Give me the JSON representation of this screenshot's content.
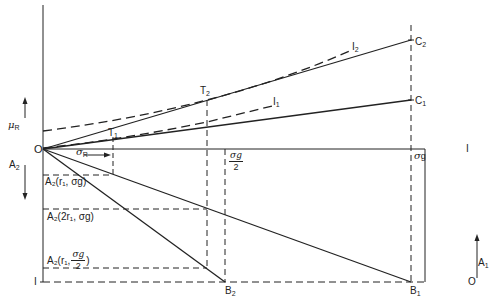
{
  "diagram": {
    "labels": {
      "origin": "O",
      "mu_R": "μ",
      "mu_R_sub": "R",
      "A2_axis": "A",
      "A2_axis_sub": "2",
      "A1_axis": "A",
      "A1_axis_sub": "1",
      "sigma_R": "σ",
      "sigma_R_sub": "R",
      "sigma_g": "σ",
      "sigma_g_sub": "g",
      "sigma_g_half_num": "σg",
      "sigma_g_half_den": "2",
      "T1": "T",
      "T1_sub": "1",
      "T2": "T",
      "T2_sub": "2",
      "I1": "I",
      "I1_sub": "1",
      "I2": "I",
      "I2_sub": "2",
      "C1": "C",
      "C1_sub": "1",
      "C2": "C",
      "C2_sub": "2",
      "B1": "B",
      "B1_sub": "1",
      "B2": "B",
      "B2_sub": "2",
      "one_top_right": "I",
      "one_bottom_left": "I",
      "zero_bottom_right": "O",
      "A2_r1_sg": "A₂(r₁, σg)",
      "A2_2r1_sg": "A₂(2r₁, σg)",
      "A2_r1_prefix": "A₂(r₁,",
      "A2_r1_half_num": "σg",
      "A2_r1_half_den": "2",
      "A2_r1_suffix": ")"
    },
    "colors": {
      "line": "#222222",
      "background": "#ffffff"
    }
  }
}
